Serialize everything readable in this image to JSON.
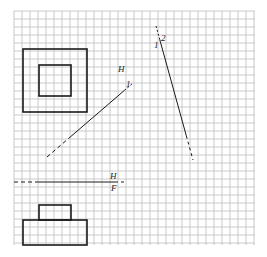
{
  "diagram": {
    "type": "orthographic-projection-exercise",
    "grid": {
      "x0": 14,
      "y0": 11,
      "x1": 255,
      "y1": 245,
      "cell": 8,
      "color": "#bdbdbd"
    },
    "colors": {
      "ink": "#1a1a1a",
      "background": "#ffffff"
    },
    "top_view": {
      "outer_square": {
        "x": 23,
        "y": 49,
        "w": 64,
        "h": 63
      },
      "inner_square": {
        "x": 39,
        "y": 65,
        "w": 32,
        "h": 31
      }
    },
    "front_view": {
      "top_block": {
        "x": 39,
        "y": 205,
        "w": 32,
        "h": 15
      },
      "base_block": {
        "x": 23,
        "y": 220,
        "w": 64,
        "h": 25
      }
    },
    "fold_line_HF": {
      "y": 182,
      "x_start": 14,
      "x_end": 127,
      "label_top": "H",
      "label_bottom": "F"
    },
    "fold_line_H1": {
      "x1": 47,
      "y1": 157,
      "x2": 133,
      "y2": 83,
      "label_top": "H",
      "label_bottom": "1"
    },
    "fold_line_12": {
      "x1": 156,
      "y1": 26,
      "x2": 193,
      "y2": 160,
      "label_left": "1",
      "label_right": "2"
    }
  }
}
